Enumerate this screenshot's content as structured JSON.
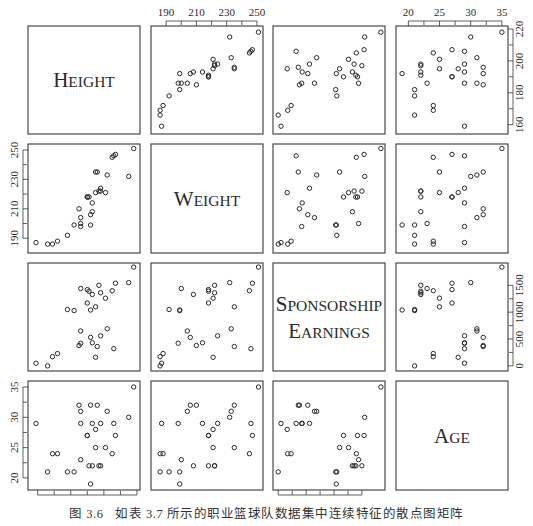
{
  "chart_data": {
    "type": "scatter_matrix",
    "title": "",
    "variables": [
      {
        "key": "height",
        "label": "Height",
        "ticks": [
          160,
          180,
          200,
          220
        ],
        "range": [
          156,
          220
        ]
      },
      {
        "key": "weight",
        "label": "Weight",
        "ticks": [
          190,
          210,
          230,
          250
        ],
        "range": [
          182,
          252
        ]
      },
      {
        "key": "sponsorship",
        "label": "Sponsorship Earnings",
        "label_lines": [
          "Sponsorship",
          "Earnings"
        ],
        "ticks": [
          0,
          500,
          1000,
          1500
        ],
        "range": [
          -40,
          1860
        ]
      },
      {
        "key": "age",
        "label": "Age",
        "ticks": [
          20,
          25,
          30,
          35
        ],
        "range": [
          18.5,
          35.5
        ]
      }
    ],
    "axis_placement": {
      "top": [
        "weight",
        "age"
      ],
      "right": [
        "height",
        "sponsorship"
      ],
      "bottom": [
        "height",
        "sponsorship"
      ],
      "left": [
        "weight",
        "age"
      ]
    },
    "n_points": 30,
    "points": [
      {
        "height": 159,
        "weight": 187,
        "sponsorship": 50,
        "age": 29
      },
      {
        "height": 166,
        "weight": 186,
        "sponsorship": 0,
        "age": 21
      },
      {
        "height": 169,
        "weight": 186,
        "sponsorship": 170,
        "age": 24
      },
      {
        "height": 172,
        "weight": 188,
        "sponsorship": 230,
        "age": 24
      },
      {
        "height": 178,
        "weight": 192,
        "sponsorship": 1050,
        "age": 21
      },
      {
        "height": 182,
        "weight": 199,
        "sponsorship": 1030,
        "age": 21
      },
      {
        "height": 185,
        "weight": 210,
        "sponsorship": 380,
        "age": 32
      },
      {
        "height": 186,
        "weight": 204,
        "sponsorship": 650,
        "age": 31
      },
      {
        "height": 186,
        "weight": 198,
        "sponsorship": 420,
        "age": 29
      },
      {
        "height": 186,
        "weight": 200,
        "sponsorship": 1440,
        "age": 23
      },
      {
        "height": 190,
        "weight": 218,
        "sponsorship": 1170,
        "age": 27
      },
      {
        "height": 190,
        "weight": 218,
        "sponsorship": 1420,
        "age": 27
      },
      {
        "height": 191,
        "weight": 218,
        "sponsorship": 1390,
        "age": 22
      },
      {
        "height": 193,
        "weight": 208,
        "sponsorship": 1330,
        "age": 22
      },
      {
        "height": 192,
        "weight": 199,
        "sponsorship": 1040,
        "age": 19
      },
      {
        "height": 192,
        "weight": 206,
        "sponsorship": 530,
        "age": 32
      },
      {
        "height": 193,
        "weight": 214,
        "sponsorship": 430,
        "age": 29
      },
      {
        "height": 195,
        "weight": 221,
        "sponsorship": 160,
        "age": 28
      },
      {
        "height": 195,
        "weight": 235,
        "sponsorship": 1100,
        "age": 25
      },
      {
        "height": 196,
        "weight": 235,
        "sponsorship": 360,
        "age": 32
      },
      {
        "height": 197,
        "weight": 222,
        "sponsorship": 1500,
        "age": 22
      },
      {
        "height": 198,
        "weight": 222,
        "sponsorship": 1360,
        "age": 22
      },
      {
        "height": 198,
        "weight": 224,
        "sponsorship": 560,
        "age": 29
      },
      {
        "height": 201,
        "weight": 221,
        "sponsorship": 1260,
        "age": 25
      },
      {
        "height": 202,
        "weight": 233,
        "sponsorship": 690,
        "age": 31
      },
      {
        "height": 205,
        "weight": 245,
        "sponsorship": 1400,
        "age": 24
      },
      {
        "height": 206,
        "weight": 246,
        "sponsorship": 320,
        "age": 29
      },
      {
        "height": 207,
        "weight": 247,
        "sponsorship": 1540,
        "age": 27
      },
      {
        "height": 215,
        "weight": 232,
        "sponsorship": 1550,
        "age": 30
      },
      {
        "height": 218,
        "weight": 251,
        "sponsorship": 1840,
        "age": 35
      }
    ],
    "marker": "open-circle",
    "grid": false
  },
  "caption": {
    "number": "图 3.6",
    "text": "如表 3.7 所示的职业篮球队数据集中连续特征的散点图矩阵"
  },
  "colors": {
    "ink": "#2b2b2b",
    "frame": "#3a3a3a",
    "background": "#ffffff"
  }
}
